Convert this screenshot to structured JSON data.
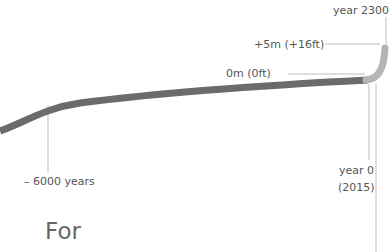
{
  "diagram": {
    "labels": {
      "year_2300": "year 2300",
      "plus_5m": "+5m (+16ft)",
      "zero_m": "0m (0ft)",
      "minus_6000": "– 6000 years",
      "year_0": "year 0",
      "year_0_sub": "(2015)"
    },
    "heading_fragment": "For",
    "colors": {
      "past_curve": "#6b6b6b",
      "future_curve": "#b5b5b5",
      "leader_lines": "#bdbdbd",
      "text": "#555555"
    }
  }
}
